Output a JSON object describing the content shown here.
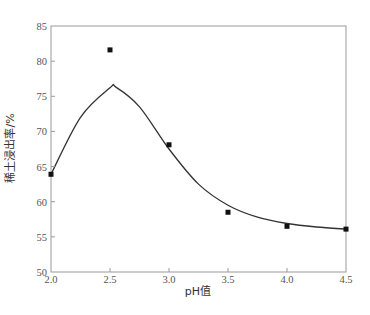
{
  "chart_data": {
    "type": "scatter",
    "title": "",
    "xlabel": "pH值",
    "ylabel": "稀土浸出率/%",
    "xlim": [
      2.0,
      4.5
    ],
    "ylim": [
      50,
      85
    ],
    "x_ticks": [
      "2.0",
      "2.5",
      "3.0",
      "3.5",
      "4.0",
      "4.5"
    ],
    "y_ticks": [
      "50",
      "55",
      "60",
      "65",
      "70",
      "75",
      "80",
      "85"
    ],
    "grid": false,
    "legend": null,
    "series": [
      {
        "name": "measured",
        "kind": "scatter",
        "marker": "square",
        "x": [
          2.0,
          2.5,
          3.0,
          3.5,
          4.0,
          4.5
        ],
        "values": [
          63.9,
          81.6,
          68.1,
          58.5,
          56.5,
          56.1
        ]
      },
      {
        "name": "fitted curve",
        "kind": "line",
        "smooth": true,
        "x": [
          2.0,
          2.25,
          2.5,
          2.55,
          2.75,
          3.0,
          3.25,
          3.5,
          3.75,
          4.0,
          4.25,
          4.5
        ],
        "values": [
          63.9,
          72.0,
          76.2,
          76.3,
          73.5,
          67.5,
          62.5,
          59.5,
          57.8,
          56.9,
          56.4,
          56.1
        ]
      }
    ]
  }
}
